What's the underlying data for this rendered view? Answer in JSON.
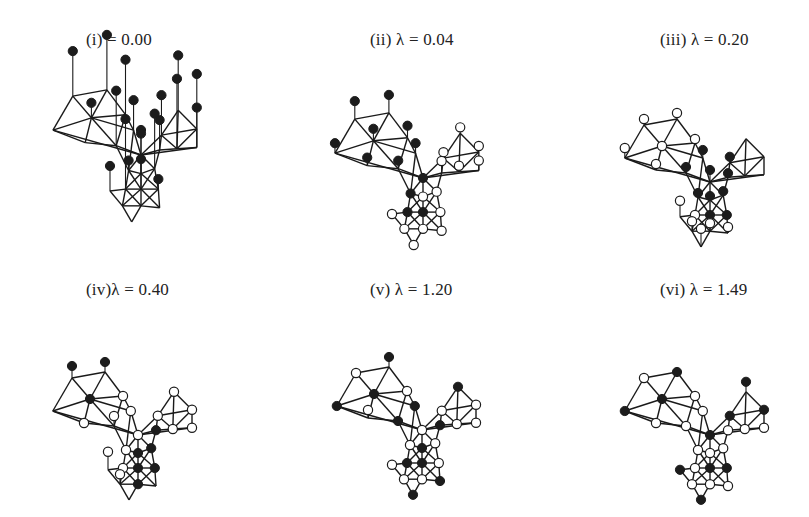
{
  "figure": {
    "legend": {
      "filled_node": "filled circle",
      "open_node": "open circle"
    }
  },
  "base_graph": {
    "comment_nodes": "node coordinates in a 0-200 x 0-220 local frame",
    "nodes": {
      "L1": [
        40,
        55
      ],
      "L2": [
        95,
        45
      ],
      "L3": [
        70,
        90
      ],
      "L4": [
        125,
        85
      ],
      "L5": [
        8,
        110
      ],
      "L6": [
        60,
        130
      ],
      "L7": [
        110,
        135
      ],
      "L8": [
        138,
        110
      ],
      "C0": [
        150,
        150
      ],
      "R1": [
        210,
        78
      ],
      "R2": [
        240,
        108
      ],
      "R3": [
        183,
        118
      ],
      "R4": [
        208,
        140
      ],
      "R5": [
        240,
        138
      ],
      "R6": [
        180,
        142
      ],
      "M1": [
        130,
        175
      ],
      "M2": [
        150,
        180
      ],
      "M3": [
        172,
        172
      ],
      "G1": [
        125,
        205
      ],
      "G2": [
        150,
        205
      ],
      "G3": [
        178,
        205
      ],
      "G4": [
        100,
        208
      ],
      "B1": [
        120,
        232
      ],
      "B2": [
        150,
        232
      ],
      "B3": [
        180,
        235
      ],
      "B4": [
        135,
        258
      ]
    },
    "edges": [
      [
        "L1",
        "L2"
      ],
      [
        "L1",
        "L3"
      ],
      [
        "L2",
        "L3"
      ],
      [
        "L2",
        "L4"
      ],
      [
        "L3",
        "L4"
      ],
      [
        "L1",
        "L5"
      ],
      [
        "L5",
        "L3"
      ],
      [
        "L5",
        "L6"
      ],
      [
        "L3",
        "L6"
      ],
      [
        "L3",
        "L7"
      ],
      [
        "L6",
        "L7"
      ],
      [
        "L4",
        "L8"
      ],
      [
        "L3",
        "L8"
      ],
      [
        "L4",
        "L7"
      ],
      [
        "L5",
        "C0"
      ],
      [
        "L7",
        "C0"
      ],
      [
        "L8",
        "C0"
      ],
      [
        "L7",
        "M1"
      ],
      [
        "L8",
        "M1"
      ],
      [
        "C0",
        "R3"
      ],
      [
        "C0",
        "R6"
      ],
      [
        "C0",
        "R5"
      ],
      [
        "R3",
        "R1"
      ],
      [
        "R1",
        "R2"
      ],
      [
        "R3",
        "R2"
      ],
      [
        "R3",
        "R4"
      ],
      [
        "R1",
        "R4"
      ],
      [
        "R2",
        "R4"
      ],
      [
        "R2",
        "R5"
      ],
      [
        "R4",
        "R5"
      ],
      [
        "R6",
        "R3"
      ],
      [
        "R6",
        "R4"
      ],
      [
        "R6",
        "M3"
      ],
      [
        "C0",
        "M1"
      ],
      [
        "C0",
        "M2"
      ],
      [
        "C0",
        "M3"
      ],
      [
        "M1",
        "M2"
      ],
      [
        "M2",
        "M3"
      ],
      [
        "M1",
        "G1"
      ],
      [
        "M1",
        "G2"
      ],
      [
        "M2",
        "G1"
      ],
      [
        "M2",
        "G2"
      ],
      [
        "M2",
        "G3"
      ],
      [
        "M3",
        "G2"
      ],
      [
        "M3",
        "G3"
      ],
      [
        "G1",
        "G2"
      ],
      [
        "G2",
        "G3"
      ],
      [
        "G4",
        "G1"
      ],
      [
        "G4",
        "B1"
      ],
      [
        "G1",
        "B1"
      ],
      [
        "G1",
        "B2"
      ],
      [
        "G2",
        "B1"
      ],
      [
        "G2",
        "B2"
      ],
      [
        "G2",
        "B3"
      ],
      [
        "G3",
        "B2"
      ],
      [
        "G3",
        "B3"
      ],
      [
        "B1",
        "B2"
      ],
      [
        "B2",
        "B3"
      ],
      [
        "B1",
        "B4"
      ],
      [
        "B2",
        "B4"
      ]
    ]
  },
  "panels": [
    {
      "id": "i",
      "label": "(i)",
      "lambda_symbol": "",
      "equals": "= 0.00",
      "lambda": 0.0,
      "title_full": "(i)     = 0.00",
      "offset": [
        48,
        62
      ],
      "scale": 0.62,
      "stems": true,
      "stem_length_default": 0,
      "node_states": {
        "L1": [
          "filled",
          45
        ],
        "L2": [
          "filled",
          55
        ],
        "L3": [
          "filled",
          15
        ],
        "L4": [
          "filled",
          55
        ],
        "L5": [
          "none",
          0
        ],
        "L6": [
          "none",
          0
        ],
        "L7": [
          "filled",
          55
        ],
        "L8": [
          "filled",
          30
        ],
        "C0": [
          "filled",
          25
        ],
        "R1": [
          "filled",
          55
        ],
        "R2": [
          "filled",
          55
        ],
        "R3": [
          "filled",
          40
        ],
        "R4": [
          "filled",
          70
        ],
        "R5": [
          "filled",
          40
        ],
        "R6": [
          "filled",
          30
        ],
        "M1": [
          "filled",
          10
        ],
        "M2": [
          "filled",
          40
        ],
        "M3": [
          "filled",
          55
        ],
        "G1": [
          "filled",
          70
        ],
        "G2": [
          "filled",
          30
        ],
        "G3": [
          "filled",
          10
        ],
        "G4": [
          "filled",
          25
        ],
        "B1": [
          "none",
          0
        ],
        "B2": [
          "none",
          0
        ],
        "B3": [
          "none",
          0
        ],
        "B4": [
          "none",
          0
        ]
      }
    },
    {
      "id": "ii",
      "label": "(ii)",
      "lambda_symbol": "λ",
      "equals": "= 0.04",
      "lambda": 0.04,
      "title_full": "(ii) λ = 0.04",
      "offset": [
        330,
        85
      ],
      "scale": 0.62,
      "stems": true,
      "node_states": {
        "L1": [
          "filled",
          18
        ],
        "L2": [
          "filled",
          18
        ],
        "L3": [
          "filled",
          12
        ],
        "L4": [
          "filled",
          12
        ],
        "L5": [
          "filled",
          10
        ],
        "L6": [
          "filled",
          8
        ],
        "L7": [
          "filled",
          8
        ],
        "L8": [
          "filled",
          10
        ],
        "C0": [
          "filled",
          0
        ],
        "R1": [
          "open",
          6
        ],
        "R2": [
          "open",
          6
        ],
        "R3": [
          "open",
          6
        ],
        "R4": [
          "open",
          6
        ],
        "R5": [
          "open",
          10
        ],
        "R6": [
          "open",
          12
        ],
        "M1": [
          "filled",
          0
        ],
        "M2": [
          "open",
          0
        ],
        "M3": [
          "open",
          0
        ],
        "G1": [
          "filled",
          0
        ],
        "G2": [
          "filled",
          0
        ],
        "G3": [
          "open",
          0
        ],
        "G4": [
          "open",
          0
        ],
        "B1": [
          "open",
          0
        ],
        "B2": [
          "open",
          0
        ],
        "B3": [
          "open",
          0
        ],
        "B4": [
          "open",
          0
        ]
      }
    },
    {
      "id": "iii",
      "label": "(iii)",
      "lambda_symbol": "λ",
      "equals": "= 0.20",
      "lambda": 0.2,
      "title_full": "(iii) λ = 0.20",
      "offset": [
        620,
        92
      ],
      "scale": 0.6,
      "stems": true,
      "node_states": {
        "L1": [
          "open",
          6
        ],
        "L2": [
          "open",
          6
        ],
        "L3": [
          "open",
          0
        ],
        "L4": [
          "open",
          4
        ],
        "L5": [
          "open",
          10
        ],
        "L6": [
          "open",
          6
        ],
        "L7": [
          "filled",
          6
        ],
        "L8": [
          "filled",
          8
        ],
        "C0": [
          "filled",
          12
        ],
        "R1": [
          "none",
          0
        ],
        "R2": [
          "none",
          0
        ],
        "R3": [
          "filled",
          6
        ],
        "R4": [
          "none",
          0
        ],
        "R5": [
          "none",
          0
        ],
        "R6": [
          "filled",
          4
        ],
        "M1": [
          "filled",
          4
        ],
        "M2": [
          "filled",
          4
        ],
        "M3": [
          "filled",
          4
        ],
        "G1": [
          "open",
          0
        ],
        "G2": [
          "filled",
          0
        ],
        "G3": [
          "filled",
          0
        ],
        "G4": [
          "open",
          16
        ],
        "B1": [
          "open",
          10
        ],
        "B2": [
          "open",
          8
        ],
        "B3": [
          "open",
          6
        ],
        "B4": [
          "open",
          18
        ]
      }
    },
    {
      "id": "iv",
      "label": "(iv)",
      "lambda_symbol": "λ",
      "equals": "= 0.40",
      "lambda": 0.4,
      "title_full": "(iv)λ = 0.40",
      "offset": [
        48,
        345
      ],
      "scale": 0.6,
      "stems": true,
      "node_states": {
        "L1": [
          "filled",
          12
        ],
        "L2": [
          "filled",
          10
        ],
        "L3": [
          "filled",
          0
        ],
        "L4": [
          "open",
          0
        ],
        "L5": [
          "none",
          0
        ],
        "L6": [
          "open",
          0
        ],
        "L7": [
          "open",
          10
        ],
        "L8": [
          "open",
          0
        ],
        "C0": [
          "open",
          0
        ],
        "R1": [
          "open",
          0
        ],
        "R2": [
          "open",
          0
        ],
        "R3": [
          "open",
          0
        ],
        "R4": [
          "open",
          0
        ],
        "R5": [
          "open",
          0
        ],
        "R6": [
          "filled",
          0
        ],
        "M1": [
          "open",
          0
        ],
        "M2": [
          "filled",
          0
        ],
        "M3": [
          "filled",
          0
        ],
        "G1": [
          "open",
          0
        ],
        "G2": [
          "filled",
          0
        ],
        "G3": [
          "filled",
          0
        ],
        "G4": [
          "open",
          18
        ],
        "B1": [
          "open",
          10
        ],
        "B2": [
          "filled",
          0
        ],
        "B3": [
          "none",
          0
        ],
        "B4": [
          "none",
          0
        ]
      }
    },
    {
      "id": "v",
      "label": "(v)",
      "lambda_symbol": "λ",
      "equals": "= 1.20",
      "lambda": 1.2,
      "title_full": "(v)  λ = 1.20",
      "offset": [
        332,
        340
      ],
      "scale": 0.6,
      "stems": true,
      "node_states": {
        "L1": [
          "open",
          0
        ],
        "L2": [
          "filled",
          10
        ],
        "L3": [
          "filled",
          0
        ],
        "L4": [
          "open",
          0
        ],
        "L5": [
          "filled",
          0
        ],
        "L6": [
          "open",
          8
        ],
        "L7": [
          "filled",
          0
        ],
        "L8": [
          "filled",
          0
        ],
        "C0": [
          "open",
          0
        ],
        "R1": [
          "filled",
          0
        ],
        "R2": [
          "open",
          0
        ],
        "R3": [
          "open",
          0
        ],
        "R4": [
          "open",
          0
        ],
        "R5": [
          "open",
          0
        ],
        "R6": [
          "filled",
          0
        ],
        "M1": [
          "open",
          0
        ],
        "M2": [
          "filled",
          0
        ],
        "M3": [
          "open",
          0
        ],
        "G1": [
          "filled",
          0
        ],
        "G2": [
          "filled",
          0
        ],
        "G3": [
          "open",
          0
        ],
        "G4": [
          "open",
          0
        ],
        "B1": [
          "open",
          0
        ],
        "B2": [
          "open",
          0
        ],
        "B3": [
          "filled",
          0
        ],
        "B4": [
          "filled",
          0
        ]
      }
    },
    {
      "id": "vi",
      "label": "(vi)",
      "lambda_symbol": "λ",
      "equals": "= 1.49",
      "lambda": 1.49,
      "title_full": "(vi) λ = 1.49",
      "offset": [
        620,
        345
      ],
      "scale": 0.6,
      "stems": true,
      "node_states": {
        "L1": [
          "open",
          0
        ],
        "L2": [
          "filled",
          0
        ],
        "L3": [
          "filled",
          0
        ],
        "L4": [
          "open",
          0
        ],
        "L5": [
          "filled",
          0
        ],
        "L6": [
          "open",
          0
        ],
        "L7": [
          "open",
          0
        ],
        "L8": [
          "open",
          0
        ],
        "C0": [
          "filled",
          0
        ],
        "R1": [
          "filled",
          10
        ],
        "R2": [
          "filled",
          0
        ],
        "R3": [
          "filled",
          0
        ],
        "R4": [
          "open",
          0
        ],
        "R5": [
          "open",
          0
        ],
        "R6": [
          "open",
          0
        ],
        "M1": [
          "open",
          0
        ],
        "M2": [
          "open",
          0
        ],
        "M3": [
          "open",
          0
        ],
        "G1": [
          "open",
          0
        ],
        "G2": [
          "filled",
          0
        ],
        "G3": [
          "filled",
          0
        ],
        "G4": [
          "filled",
          0
        ],
        "B1": [
          "open",
          0
        ],
        "B2": [
          "open",
          0
        ],
        "B3": [
          "open",
          0
        ],
        "B4": [
          "filled",
          0
        ]
      }
    }
  ],
  "panel_layout": [
    {
      "left": 0,
      "top": 0,
      "title_left": 86
    },
    {
      "left": 270,
      "top": 0,
      "title_left": 100
    },
    {
      "left": 540,
      "top": 0,
      "title_left": 120
    },
    {
      "left": 0,
      "top": 258,
      "title_left": 86
    },
    {
      "left": 270,
      "top": 258,
      "title_left": 100
    },
    {
      "left": 540,
      "top": 258,
      "title_left": 120
    }
  ]
}
